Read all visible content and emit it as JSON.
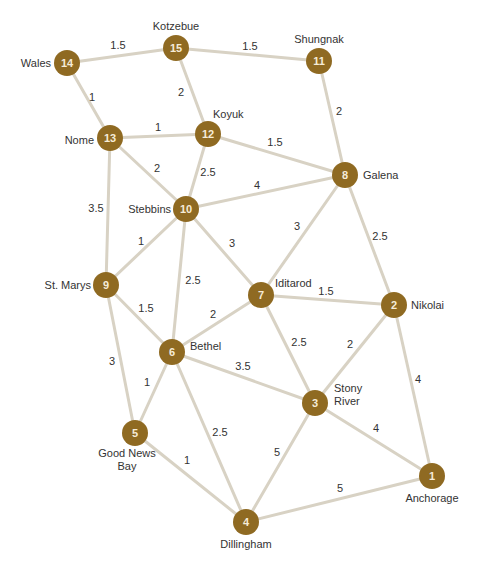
{
  "diagram": {
    "type": "weighted-undirected-graph",
    "colors": {
      "node_fill": "#8f6a22",
      "node_text": "#f6ecd8",
      "edge": "#d8d2c4",
      "label_text": "#333333"
    },
    "nodes": [
      {
        "id": "1",
        "name": [
          "Anchorage"
        ]
      },
      {
        "id": "2",
        "name": [
          "Nikolai"
        ]
      },
      {
        "id": "3",
        "name": [
          "Stony",
          "River"
        ]
      },
      {
        "id": "4",
        "name": [
          "Dillingham"
        ]
      },
      {
        "id": "5",
        "name": [
          "Good News",
          "Bay"
        ]
      },
      {
        "id": "6",
        "name": [
          "Bethel"
        ]
      },
      {
        "id": "7",
        "name": [
          "Iditarod"
        ]
      },
      {
        "id": "8",
        "name": [
          "Galena"
        ]
      },
      {
        "id": "9",
        "name": [
          "St. Marys"
        ]
      },
      {
        "id": "10",
        "name": [
          "Stebbins"
        ]
      },
      {
        "id": "11",
        "name": [
          "Shungnak"
        ]
      },
      {
        "id": "12",
        "name": [
          "Koyuk"
        ]
      },
      {
        "id": "13",
        "name": [
          "Nome"
        ]
      },
      {
        "id": "14",
        "name": [
          "Wales"
        ]
      },
      {
        "id": "15",
        "name": [
          "Kotzebue"
        ]
      }
    ],
    "edges": [
      {
        "from": "14",
        "to": "15",
        "weight": "1.5"
      },
      {
        "from": "15",
        "to": "11",
        "weight": "1.5"
      },
      {
        "from": "14",
        "to": "13",
        "weight": "1"
      },
      {
        "from": "15",
        "to": "12",
        "weight": "2"
      },
      {
        "from": "13",
        "to": "12",
        "weight": "1"
      },
      {
        "from": "11",
        "to": "8",
        "weight": "2"
      },
      {
        "from": "12",
        "to": "8",
        "weight": "1.5"
      },
      {
        "from": "13",
        "to": "10",
        "weight": "2"
      },
      {
        "from": "12",
        "to": "10",
        "weight": "2.5"
      },
      {
        "from": "10",
        "to": "8",
        "weight": "4"
      },
      {
        "from": "13",
        "to": "9",
        "weight": "3.5"
      },
      {
        "from": "10",
        "to": "9",
        "weight": "1"
      },
      {
        "from": "10",
        "to": "7",
        "weight": "3"
      },
      {
        "from": "8",
        "to": "7",
        "weight": "3"
      },
      {
        "from": "8",
        "to": "2",
        "weight": "2.5"
      },
      {
        "from": "10",
        "to": "6",
        "weight": "2.5"
      },
      {
        "from": "9",
        "to": "6",
        "weight": "1.5"
      },
      {
        "from": "7",
        "to": "6",
        "weight": "2"
      },
      {
        "from": "7",
        "to": "2",
        "weight": "1.5"
      },
      {
        "from": "9",
        "to": "5",
        "weight": "3"
      },
      {
        "from": "6",
        "to": "5",
        "weight": "1"
      },
      {
        "from": "6",
        "to": "3",
        "weight": "3.5"
      },
      {
        "from": "7",
        "to": "3",
        "weight": "2.5"
      },
      {
        "from": "2",
        "to": "3",
        "weight": "2"
      },
      {
        "from": "2",
        "to": "1",
        "weight": "4"
      },
      {
        "from": "6",
        "to": "4",
        "weight": "2.5"
      },
      {
        "from": "5",
        "to": "4",
        "weight": "1"
      },
      {
        "from": "3",
        "to": "4",
        "weight": "5"
      },
      {
        "from": "3",
        "to": "1",
        "weight": "4"
      },
      {
        "from": "4",
        "to": "1",
        "weight": "5"
      }
    ]
  }
}
